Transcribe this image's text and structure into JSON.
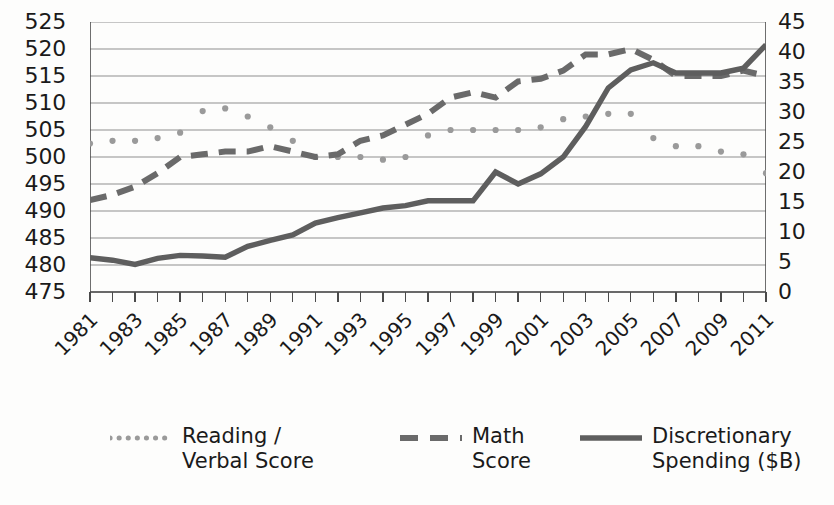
{
  "chart_data": {
    "type": "line",
    "title": "",
    "xlabel": "",
    "grid": true,
    "legend_position": "bottom",
    "x": [
      1981,
      1982,
      1983,
      1984,
      1985,
      1986,
      1987,
      1988,
      1989,
      1990,
      1991,
      1992,
      1993,
      1994,
      1995,
      1996,
      1997,
      1998,
      1999,
      2000,
      2001,
      2002,
      2003,
      2004,
      2005,
      2006,
      2007,
      2008,
      2009,
      2010,
      2011
    ],
    "x_tick_labels": [
      "1981",
      "1983",
      "1985",
      "1987",
      "1989",
      "1991",
      "1993",
      "1995",
      "1997",
      "1999",
      "2001",
      "2003",
      "2005",
      "2007",
      "2009",
      "2011"
    ],
    "left_axis": {
      "label": "",
      "ylim": [
        475,
        525
      ],
      "ticks": [
        525,
        520,
        515,
        510,
        505,
        500,
        495,
        490,
        485,
        480,
        475
      ]
    },
    "right_axis": {
      "label": "",
      "ylim": [
        0,
        45
      ],
      "ticks": [
        45,
        40,
        35,
        30,
        25,
        20,
        15,
        10,
        5,
        0
      ]
    },
    "series": [
      {
        "name": "Reading /\nVerbal Score",
        "legend_label": "Reading /\nVerbal Score",
        "axis": "left",
        "style": "dotted",
        "color": "#9a9a9a",
        "values": [
          502.5,
          503,
          503,
          503.5,
          504.5,
          508.5,
          509,
          507.5,
          505.5,
          503,
          500,
          500,
          500,
          499.5,
          500,
          504,
          505,
          505,
          505,
          505,
          505.5,
          507,
          507.5,
          508,
          508,
          503.5,
          502,
          502,
          501,
          500.5,
          497
        ]
      },
      {
        "name": "Math Score",
        "legend_label": "Math\nScore",
        "axis": "left",
        "style": "dashed",
        "color": "#6a6a6a",
        "values": [
          492,
          493,
          494.5,
          497,
          500,
          500.5,
          501,
          501,
          502,
          501,
          500,
          500.5,
          503,
          504,
          506,
          508,
          511,
          512,
          511,
          514,
          514.5,
          516,
          519,
          519,
          520,
          518,
          515,
          515,
          515,
          516,
          515
        ]
      },
      {
        "name": "Discretionary Spending ($B)",
        "legend_label": "Discretionary\nSpending ($B)",
        "axis": "right",
        "style": "solid",
        "color": "#5e5e5e",
        "values": [
          5.7,
          5.3,
          4.6,
          5.6,
          6.1,
          6.0,
          5.8,
          7.6,
          8.6,
          9.5,
          11.5,
          12.4,
          13.2,
          14.0,
          14.4,
          15.2,
          15.2,
          15.2,
          20.0,
          18.0,
          19.7,
          22.5,
          27.6,
          34.0,
          37.0,
          38.2,
          36.5,
          36.5,
          36.5,
          37.3,
          41.2
        ]
      }
    ]
  },
  "legend": {
    "items": [
      {
        "label": "Reading /\nVerbal Score",
        "style": "dotted"
      },
      {
        "label": "Math\nScore",
        "style": "dashed"
      },
      {
        "label": "Discretionary\nSpending ($B)",
        "style": "solid"
      }
    ]
  }
}
